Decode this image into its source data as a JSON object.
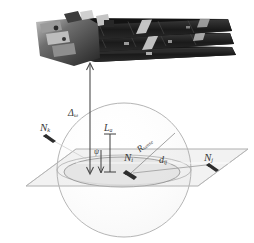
{
  "figure": {
    "name": "satellite-sensing-geometry-diagram",
    "type": "technical-schematic",
    "background": "#ffffff"
  },
  "satellite": {
    "name": "cubesat-with-deployed-solar-arrays",
    "description": "small satellite photograph, dark body with three stacked deployed panel rows",
    "body_color": "#1c1c1c",
    "panel_color": "#2e2e2e",
    "highlight_color": "#d8d8d8"
  },
  "geometry": {
    "sphere_label": "sensing-sphere",
    "plane_label": "ground-plane",
    "disk_label": "footprint-ellipse",
    "sphere_stroke": "#9a9a9a",
    "plane_fill": "#f2f2f2",
    "plane_stroke": "#b4b4b4",
    "disk_fill": "#e3e3e3",
    "disk_stroke": "#8d8d8d",
    "arrow_color": "#4a4a4a"
  },
  "labels": {
    "delta": {
      "base": "Δ",
      "sub": "ω"
    },
    "length_a": {
      "base": "L",
      "sub": "a"
    },
    "radius_sense": {
      "base": "R",
      "sub": "sense"
    },
    "distance_ij": {
      "base": "d",
      "sub": "ij"
    },
    "node_k": {
      "base": "N",
      "sub": "k"
    },
    "node_i": {
      "base": "N",
      "sub": "i"
    },
    "node_j": {
      "base": "N",
      "sub": "j"
    },
    "height_psi": {
      "base": "ψ",
      "sub": ""
    }
  },
  "colors": {
    "text": "#3a3a3a",
    "line": "#8d8d8d",
    "arrow": "#4a4a4a"
  }
}
